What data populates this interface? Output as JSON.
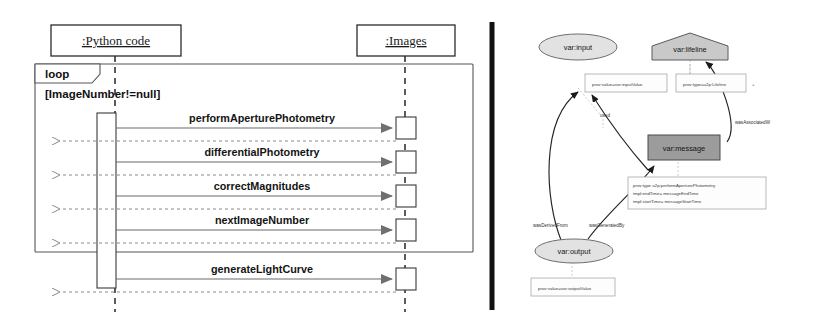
{
  "figure": {
    "left_panel": {
      "type": "uml-sequence-diagram",
      "lifelines": [
        {
          "id": "python",
          "label": ":Python code",
          "x": 115
        },
        {
          "id": "images",
          "label": ":Images",
          "x": 405
        }
      ],
      "combined_fragment": {
        "operator": "loop",
        "guard": "[ImageNumber!=null]"
      },
      "messages": [
        {
          "label": "performAperturePhotometry",
          "kind": "call",
          "from": "python",
          "to": "images"
        },
        {
          "label": "",
          "kind": "return",
          "from": "images",
          "to": "python"
        },
        {
          "label": "differentialPhotometry",
          "kind": "call",
          "from": "python",
          "to": "images"
        },
        {
          "label": "",
          "kind": "return",
          "from": "images",
          "to": "python"
        },
        {
          "label": "correctMagnitudes",
          "kind": "call",
          "from": "python",
          "to": "images"
        },
        {
          "label": "",
          "kind": "return",
          "from": "images",
          "to": "python"
        },
        {
          "label": "nextImageNumber",
          "kind": "call",
          "from": "python",
          "to": "images"
        },
        {
          "label": "",
          "kind": "return",
          "from": "images",
          "to": "python"
        },
        {
          "label": "generateLightCurve",
          "kind": "call",
          "from": "python",
          "to": "images"
        },
        {
          "label": "",
          "kind": "return",
          "from": "images",
          "to": "python"
        }
      ]
    },
    "right_panel": {
      "type": "prov-template-graph",
      "nodes": [
        {
          "id": "input",
          "label": "var:input",
          "shape": "ellipse",
          "role": "entity"
        },
        {
          "id": "lifeline",
          "label": "var:lifeline",
          "shape": "pentagon",
          "role": "agent"
        },
        {
          "id": "message",
          "label": "var:message",
          "shape": "rectangle",
          "role": "activity"
        },
        {
          "id": "output",
          "label": "var:output",
          "shape": "ellipse",
          "role": "entity"
        }
      ],
      "attribute_boxes": [
        {
          "id": "input-attrs",
          "attached_to": "input",
          "lines": [
            "prov:value=var:inputValue"
          ]
        },
        {
          "id": "lifeline-attrs",
          "attached_to": "lifeline",
          "lines": [
            "prov:type=u2p:Lifeline"
          ]
        },
        {
          "id": "message-attrs",
          "attached_to": "message",
          "lines": [
            "prov:type     u2p:performAperturePhotometry",
            "tmpl:endTime= messageEndTime",
            "tmpl:startTime= messageStartTime"
          ]
        },
        {
          "id": "output-attrs",
          "attached_to": "output",
          "lines": [
            "prov:value=var:outputValue"
          ]
        }
      ],
      "edges": [
        {
          "id": "used",
          "label": "used",
          "from": "message",
          "to": "input"
        },
        {
          "id": "wasAssociatedWith",
          "label": "wasAssociatedW",
          "from": "message",
          "to": "lifeline"
        },
        {
          "id": "wasDerivedFrom",
          "label": "wasDerivedFrom",
          "from": "output",
          "to": "input"
        },
        {
          "id": "wasGeneratedBy",
          "label": "wasGeneratedBy",
          "from": "output",
          "to": "message"
        }
      ]
    },
    "divider": {
      "orientation": "vertical",
      "color": "#111111"
    }
  }
}
